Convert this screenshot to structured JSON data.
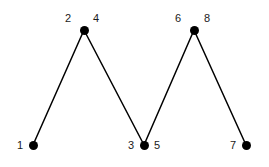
{
  "figure": {
    "background_color": "#ffffff",
    "ink_color": "#000000",
    "label_color": "#1a1a1a",
    "width": 269,
    "height": 167
  },
  "graph": {
    "node_radius": 4.5,
    "edge_width": 1.5,
    "nodes": [
      {
        "id": "v1",
        "name": "bottom-left-vertex",
        "x": 33,
        "y": 145
      },
      {
        "id": "v2",
        "name": "top-left-vertex",
        "x": 84,
        "y": 30
      },
      {
        "id": "v3",
        "name": "bottom-middle-vertex",
        "x": 144,
        "y": 145
      },
      {
        "id": "v4",
        "name": "top-right-vertex",
        "x": 194,
        "y": 30
      },
      {
        "id": "v5",
        "name": "bottom-right-vertex",
        "x": 246,
        "y": 145
      }
    ],
    "edges": [
      {
        "id": "e1",
        "name": "edge-v1-v2",
        "from": "v1",
        "to": "v2"
      },
      {
        "id": "e2",
        "name": "edge-v2-v3",
        "from": "v2",
        "to": "v3"
      },
      {
        "id": "e3",
        "name": "edge-v3-v4",
        "from": "v3",
        "to": "v4"
      },
      {
        "id": "e4",
        "name": "edge-v4-v5",
        "from": "v4",
        "to": "v5"
      }
    ],
    "labels": [
      {
        "id": "l1",
        "name": "label-1",
        "text": "1",
        "x": 20,
        "y": 145
      },
      {
        "id": "l2",
        "name": "label-2",
        "text": "2",
        "x": 68,
        "y": 18
      },
      {
        "id": "l3",
        "name": "label-4",
        "text": "4",
        "x": 96,
        "y": 18
      },
      {
        "id": "l4",
        "name": "label-3",
        "text": "3",
        "x": 131,
        "y": 145
      },
      {
        "id": "l5",
        "name": "label-5",
        "text": "5",
        "x": 157,
        "y": 145
      },
      {
        "id": "l6",
        "name": "label-6",
        "text": "6",
        "x": 178,
        "y": 18
      },
      {
        "id": "l7",
        "name": "label-8",
        "text": "8",
        "x": 207,
        "y": 18
      },
      {
        "id": "l8",
        "name": "label-7",
        "text": "7",
        "x": 233,
        "y": 145
      }
    ]
  }
}
